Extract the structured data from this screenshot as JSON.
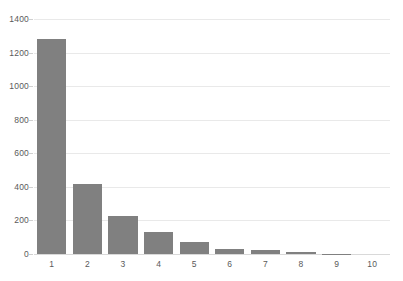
{
  "chart_data": {
    "type": "bar",
    "title": "",
    "subtitle": "",
    "xlabel": "",
    "ylabel": "",
    "categories": [
      "1",
      "2",
      "3",
      "4",
      "5",
      "6",
      "7",
      "8",
      "9",
      "10"
    ],
    "values": [
      1280,
      420,
      225,
      130,
      70,
      30,
      22,
      10,
      3,
      0
    ],
    "series": [
      {
        "name": "",
        "values": [
          1280,
          420,
          225,
          130,
          70,
          30,
          22,
          10,
          3,
          0
        ]
      }
    ],
    "ylim": [
      0,
      1400
    ],
    "ytick_labels": [
      "0",
      "200",
      "400",
      "600",
      "800",
      "1000",
      "1200",
      "1400"
    ],
    "ytick_values": [
      0,
      200,
      400,
      600,
      800,
      1000,
      1200,
      1400
    ],
    "xtick_labels": [
      "1",
      "2",
      "3",
      "4",
      "5",
      "6",
      "7",
      "8",
      "9",
      "10"
    ],
    "grid": true,
    "grid_axis": "y",
    "legend": false,
    "legend_position": "none",
    "annotations": [],
    "colors": {
      "bar": "#808080",
      "gridline": "#e9e9e9",
      "baseline": "#d9d9d9",
      "tick_text": "#5a5a5a",
      "background": "#ffffff"
    }
  }
}
